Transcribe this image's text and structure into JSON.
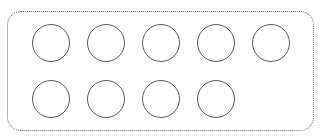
{
  "diagram": {
    "frame": {
      "style": "dotted-rounded-rectangle",
      "color": "#666666"
    },
    "circle_color": "#5a5a5a",
    "rows": [
      {
        "count": 5,
        "circles": [
          {
            "cx": 51,
            "cy": 43
          },
          {
            "cx": 106,
            "cy": 43
          },
          {
            "cx": 161,
            "cy": 43
          },
          {
            "cx": 216,
            "cy": 43
          },
          {
            "cx": 271,
            "cy": 43
          }
        ]
      },
      {
        "count": 4,
        "circles": [
          {
            "cx": 51,
            "cy": 99
          },
          {
            "cx": 106,
            "cy": 99
          },
          {
            "cx": 161,
            "cy": 99
          },
          {
            "cx": 216,
            "cy": 99
          }
        ]
      }
    ],
    "total_circles": 9
  }
}
